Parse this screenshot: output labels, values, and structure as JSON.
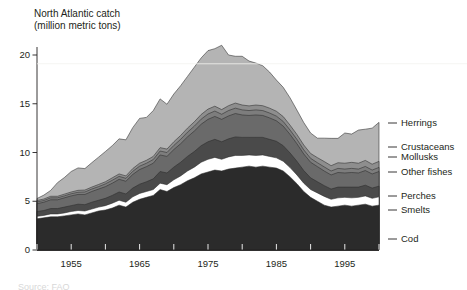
{
  "chart_data": {
    "type": "area",
    "stacked": true,
    "title": "North Atlantic catch\n(million metric tons)",
    "xlabel": "",
    "ylabel": "million metric tons",
    "ylim": [
      0,
      21.5
    ],
    "xlim": [
      1950,
      2001
    ],
    "yticks": [
      0,
      5,
      10,
      15,
      20
    ],
    "xticks": [
      1955,
      1965,
      1975,
      1985,
      1995
    ],
    "xminorticks": [
      1950,
      1960,
      1970,
      1980,
      1990,
      2000
    ],
    "grid": false,
    "legend_position": "right-inline",
    "x": [
      1950,
      1951,
      1952,
      1953,
      1954,
      1955,
      1956,
      1957,
      1958,
      1959,
      1960,
      1961,
      1962,
      1963,
      1964,
      1965,
      1966,
      1967,
      1968,
      1969,
      1970,
      1971,
      1972,
      1973,
      1974,
      1975,
      1976,
      1977,
      1978,
      1979,
      1980,
      1981,
      1982,
      1983,
      1984,
      1985,
      1986,
      1987,
      1988,
      1989,
      1990,
      1991,
      1992,
      1993,
      1994,
      1995,
      1996,
      1997,
      1998,
      1999,
      2000
    ],
    "series": [
      {
        "name": "Cod",
        "color": "#2b2b2b",
        "values": [
          3.2,
          3.3,
          3.4,
          3.4,
          3.5,
          3.6,
          3.7,
          3.6,
          3.8,
          4.0,
          4.1,
          4.3,
          4.6,
          4.4,
          4.9,
          5.2,
          5.4,
          5.6,
          6.2,
          6.0,
          6.4,
          6.7,
          7.1,
          7.4,
          7.8,
          8.0,
          8.2,
          8.1,
          8.3,
          8.4,
          8.5,
          8.6,
          8.5,
          8.6,
          8.5,
          8.4,
          8.1,
          7.5,
          6.8,
          6.0,
          5.4,
          5.0,
          4.6,
          4.4,
          4.5,
          4.6,
          4.5,
          4.6,
          4.7,
          4.5,
          4.6
        ]
      },
      {
        "name": "Smelts",
        "color": "#ffffff",
        "values": [
          0.25,
          0.25,
          0.3,
          0.3,
          0.3,
          0.35,
          0.35,
          0.4,
          0.4,
          0.4,
          0.45,
          0.5,
          0.5,
          0.5,
          0.55,
          0.6,
          0.6,
          0.6,
          0.65,
          0.7,
          0.8,
          0.9,
          1.0,
          1.1,
          1.2,
          1.3,
          1.3,
          1.2,
          1.25,
          1.3,
          1.2,
          1.15,
          1.2,
          1.15,
          1.1,
          1.05,
          1.0,
          0.95,
          0.9,
          0.85,
          0.8,
          0.85,
          0.9,
          0.8,
          0.85,
          0.8,
          0.85,
          0.8,
          0.85,
          0.8,
          0.85
        ]
      },
      {
        "name": "Perches",
        "color": "#4a4a4a",
        "values": [
          0.5,
          0.5,
          0.55,
          0.55,
          0.6,
          0.6,
          0.65,
          0.65,
          0.7,
          0.7,
          0.75,
          0.8,
          0.85,
          0.85,
          0.9,
          0.95,
          1.0,
          1.1,
          1.2,
          1.2,
          1.3,
          1.4,
          1.5,
          1.6,
          1.7,
          1.8,
          1.85,
          1.8,
          1.85,
          1.9,
          1.85,
          1.8,
          1.85,
          1.8,
          1.75,
          1.7,
          1.6,
          1.5,
          1.4,
          1.3,
          1.2,
          1.15,
          1.1,
          1.05,
          1.1,
          1.05,
          1.1,
          1.05,
          1.1,
          1.05,
          1.1
        ]
      },
      {
        "name": "Other fishes",
        "color": "#6a6a6a",
        "values": [
          0.8,
          0.85,
          0.9,
          0.9,
          0.95,
          1.0,
          1.0,
          1.05,
          1.1,
          1.15,
          1.2,
          1.25,
          1.3,
          1.3,
          1.4,
          1.5,
          1.55,
          1.6,
          1.7,
          1.7,
          1.8,
          1.9,
          2.0,
          2.1,
          2.2,
          2.3,
          2.35,
          2.3,
          2.35,
          2.4,
          2.3,
          2.25,
          2.3,
          2.25,
          2.2,
          2.1,
          2.0,
          1.9,
          1.8,
          1.7,
          1.6,
          1.55,
          1.5,
          1.45,
          1.5,
          1.45,
          1.5,
          1.45,
          1.5,
          1.45,
          1.5
        ]
      },
      {
        "name": "Mollusks",
        "color": "#7d7d7d",
        "values": [
          0.18,
          0.18,
          0.2,
          0.2,
          0.2,
          0.22,
          0.22,
          0.25,
          0.25,
          0.25,
          0.28,
          0.3,
          0.3,
          0.3,
          0.32,
          0.35,
          0.35,
          0.38,
          0.4,
          0.4,
          0.42,
          0.45,
          0.48,
          0.5,
          0.52,
          0.55,
          0.55,
          0.52,
          0.55,
          0.55,
          0.52,
          0.5,
          0.52,
          0.5,
          0.5,
          0.48,
          0.48,
          0.45,
          0.45,
          0.42,
          0.4,
          0.4,
          0.42,
          0.4,
          0.42,
          0.4,
          0.42,
          0.4,
          0.42,
          0.4,
          0.42
        ]
      },
      {
        "name": "Crustaceans",
        "color": "#8e8e8e",
        "values": [
          0.15,
          0.15,
          0.16,
          0.16,
          0.18,
          0.18,
          0.2,
          0.2,
          0.2,
          0.22,
          0.22,
          0.25,
          0.25,
          0.25,
          0.28,
          0.3,
          0.3,
          0.32,
          0.35,
          0.35,
          0.38,
          0.4,
          0.42,
          0.45,
          0.48,
          0.5,
          0.5,
          0.48,
          0.5,
          0.52,
          0.5,
          0.48,
          0.5,
          0.5,
          0.5,
          0.5,
          0.5,
          0.5,
          0.5,
          0.5,
          0.5,
          0.52,
          0.55,
          0.55,
          0.58,
          0.6,
          0.62,
          0.6,
          0.62,
          0.6,
          0.62
        ]
      },
      {
        "name": "Herrings",
        "color": "#b4b4b4",
        "values": [
          0.2,
          0.4,
          0.6,
          1.4,
          1.7,
          2.1,
          2.3,
          2.2,
          2.5,
          2.8,
          3.1,
          3.3,
          3.6,
          3.7,
          4.2,
          4.6,
          4.4,
          4.7,
          5.0,
          4.6,
          4.9,
          5.1,
          5.3,
          5.6,
          5.8,
          6.0,
          5.9,
          6.6,
          5.2,
          4.8,
          5.0,
          4.6,
          4.3,
          4.1,
          3.7,
          3.2,
          3.0,
          2.8,
          2.5,
          2.3,
          2.1,
          2.0,
          2.4,
          2.8,
          2.5,
          3.1,
          2.9,
          3.4,
          3.2,
          3.7,
          4.0
        ]
      }
    ],
    "legend_entries": [
      {
        "label": "Herrings",
        "color": "#b4b4b4",
        "y": 123
      },
      {
        "label": "Crustaceans",
        "color": "#8e8e8e",
        "y": 147
      },
      {
        "label": "Mollusks",
        "color": "#7d7d7d",
        "y": 157
      },
      {
        "label": "Other fishes",
        "color": "#6a6a6a",
        "y": 172
      },
      {
        "label": "Perches",
        "color": "#4a4a4a",
        "y": 196
      },
      {
        "label": "Smelts",
        "color": "#ffffff",
        "y": 210
      },
      {
        "label": "Cod",
        "color": "#2b2b2b",
        "y": 239
      }
    ]
  },
  "axes": {
    "ytick_labels": [
      "20",
      "15",
      "10",
      "5",
      "0"
    ],
    "xtick_labels": [
      "1955",
      "1965",
      "1975",
      "1985",
      "1995"
    ]
  },
  "footer": {
    "cropped_text": "Source: FAO"
  }
}
